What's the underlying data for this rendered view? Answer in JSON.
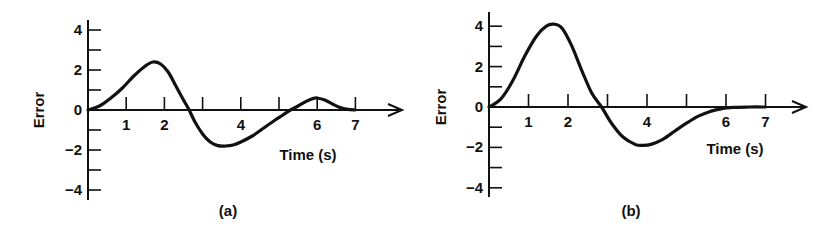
{
  "chart_data": [
    {
      "type": "line",
      "panel": "a",
      "caption": "(a)",
      "title": "",
      "xlabel": "Time (s)",
      "ylabel": "Error",
      "xlim": [
        0,
        7.5
      ],
      "ylim": [
        -4.5,
        4.5
      ],
      "xticks": [
        1,
        2,
        3,
        4,
        5,
        6,
        7
      ],
      "xtick_labels": [
        "1",
        "2",
        "",
        "4",
        "",
        "6",
        "7"
      ],
      "yticks": [
        4,
        3,
        2,
        1,
        0,
        -1,
        -2,
        -3,
        -4
      ],
      "ytick_labels": [
        "4",
        "",
        "2",
        "",
        "0",
        "",
        "−2",
        "",
        "−4"
      ],
      "grid": false,
      "series": [
        {
          "name": "Error",
          "x": [
            0,
            0.3,
            0.6,
            0.9,
            1.2,
            1.5,
            1.7,
            1.9,
            2.1,
            2.3,
            2.5,
            2.65,
            2.8,
            3.0,
            3.2,
            3.4,
            3.6,
            3.8,
            4.0,
            4.3,
            4.6,
            4.9,
            5.1,
            5.3,
            5.5,
            5.7,
            5.9,
            6.0,
            6.2,
            6.4,
            6.6,
            6.8,
            7.0
          ],
          "y": [
            0,
            0.2,
            0.6,
            1.1,
            1.7,
            2.2,
            2.4,
            2.3,
            1.9,
            1.2,
            0.5,
            0.0,
            -0.6,
            -1.2,
            -1.6,
            -1.78,
            -1.8,
            -1.75,
            -1.6,
            -1.3,
            -0.9,
            -0.5,
            -0.25,
            0.0,
            0.2,
            0.42,
            0.58,
            0.6,
            0.5,
            0.3,
            0.12,
            0.03,
            0.0
          ]
        }
      ]
    },
    {
      "type": "line",
      "panel": "b",
      "caption": "(b)",
      "title": "",
      "xlabel": "Time (s)",
      "ylabel": "Error",
      "xlim": [
        0,
        7.5
      ],
      "ylim": [
        -4.5,
        4.5
      ],
      "xticks": [
        1,
        2,
        3,
        4,
        5,
        6,
        7
      ],
      "xtick_labels": [
        "1",
        "2",
        "",
        "4",
        "",
        "6",
        "7"
      ],
      "yticks": [
        4,
        3,
        2,
        1,
        0,
        -1,
        -2,
        -3,
        -4
      ],
      "ytick_labels": [
        "4",
        "",
        "2",
        "",
        "0",
        "",
        "−2",
        "",
        "−4"
      ],
      "grid": false,
      "series": [
        {
          "name": "Error",
          "x": [
            0,
            0.3,
            0.6,
            0.9,
            1.2,
            1.45,
            1.65,
            1.85,
            2.1,
            2.35,
            2.6,
            2.85,
            3.1,
            3.4,
            3.7,
            3.9,
            4.1,
            4.4,
            4.7,
            5.0,
            5.3,
            5.6,
            5.9,
            6.2,
            6.6,
            7.0
          ],
          "y": [
            0,
            0.4,
            1.3,
            2.5,
            3.5,
            4.0,
            4.1,
            3.9,
            3.0,
            1.8,
            0.7,
            0.0,
            -0.8,
            -1.5,
            -1.85,
            -1.9,
            -1.85,
            -1.6,
            -1.2,
            -0.8,
            -0.45,
            -0.22,
            -0.08,
            -0.02,
            0.0,
            0.0
          ]
        }
      ]
    }
  ]
}
